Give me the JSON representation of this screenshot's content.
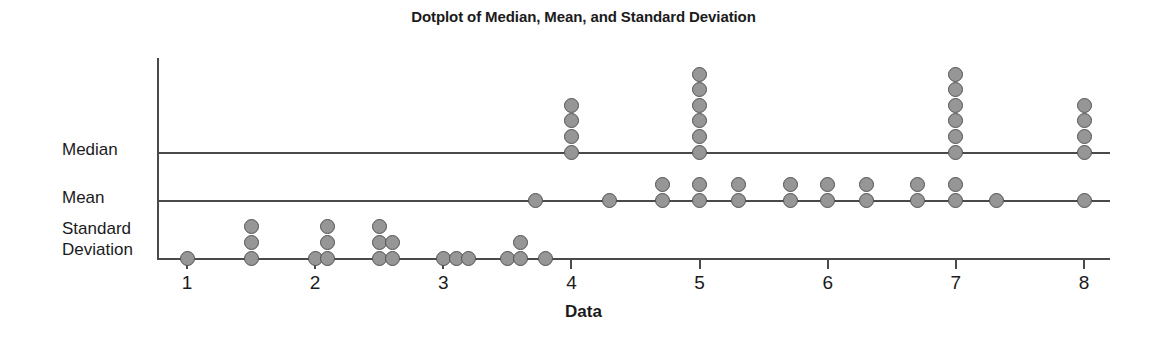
{
  "chart_data": {
    "type": "scatter",
    "title": "Dotplot of Median, Mean, and Standard Deviation",
    "xlabel": "Data",
    "ylabel": "",
    "xlim": [
      0.75,
      8.3
    ],
    "xticks": [
      1,
      2,
      3,
      4,
      5,
      6,
      7,
      8
    ],
    "xticklabels": [
      "1",
      "2",
      "3",
      "4",
      "5",
      "6",
      "7",
      "8"
    ],
    "grid": false,
    "legend": false,
    "rows": [
      {
        "name": "Median",
        "label": "Median",
        "stacks": [
          {
            "x": 4,
            "count": 4
          },
          {
            "x": 5,
            "count": 6
          },
          {
            "x": 7,
            "count": 6
          },
          {
            "x": 8,
            "count": 4
          }
        ]
      },
      {
        "name": "Mean",
        "label": "Mean",
        "stacks": [
          {
            "x": 3.72,
            "count": 1
          },
          {
            "x": 4.3,
            "count": 1
          },
          {
            "x": 4.71,
            "count": 2
          },
          {
            "x": 5.0,
            "count": 2
          },
          {
            "x": 5.3,
            "count": 2
          },
          {
            "x": 5.71,
            "count": 2
          },
          {
            "x": 6.0,
            "count": 2
          },
          {
            "x": 6.3,
            "count": 2
          },
          {
            "x": 6.7,
            "count": 2
          },
          {
            "x": 7.0,
            "count": 2
          },
          {
            "x": 7.32,
            "count": 1
          },
          {
            "x": 8.0,
            "count": 1
          }
        ]
      },
      {
        "name": "Standard Deviation",
        "label": "Standard\nDeviation",
        "stacks": [
          {
            "x": 1.0,
            "count": 1
          },
          {
            "x": 1.5,
            "count": 3
          },
          {
            "x": 2.0,
            "count": 1
          },
          {
            "x": 2.1,
            "count": 3
          },
          {
            "x": 2.5,
            "count": 3
          },
          {
            "x": 2.6,
            "count": 2
          },
          {
            "x": 3.0,
            "count": 1
          },
          {
            "x": 3.1,
            "count": 1
          },
          {
            "x": 3.2,
            "count": 1
          },
          {
            "x": 3.5,
            "count": 1
          },
          {
            "x": 3.6,
            "count": 2
          },
          {
            "x": 3.8,
            "count": 1
          }
        ]
      }
    ],
    "colors": {
      "dot_fill": "#969696",
      "dot_stroke": "#525252",
      "axis": "#4a4a4a",
      "text": "#1b1b1b",
      "background": "#ffffff"
    }
  }
}
